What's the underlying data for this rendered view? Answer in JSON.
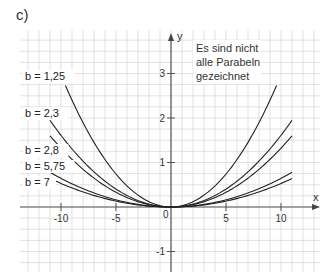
{
  "part_label": "c)",
  "chart_data": {
    "type": "line",
    "title": "",
    "xlabel": "x",
    "ylabel": "y",
    "xlim": [
      -14,
      13.5
    ],
    "ylim": [
      -1.45,
      3.9
    ],
    "grid": true,
    "grid_step_x": 1,
    "grid_step_y": 0.25,
    "x_ticks": [
      -10,
      -5,
      5,
      10
    ],
    "x_tick_labels": [
      "-10",
      "-5",
      "5",
      "10"
    ],
    "y_ticks": [
      3,
      2,
      1,
      -1
    ],
    "y_tick_labels": [
      "3",
      "2",
      "1",
      "-1"
    ],
    "origin_label": "0",
    "function": "y = x^2 / (27 * b)",
    "series": [
      {
        "name": "b = 1,25",
        "b": 1.25,
        "x_range": [
          -9.6,
          9.6
        ]
      },
      {
        "name": "b = 2,3",
        "b": 2.3,
        "x_range": [
          -11,
          11
        ]
      },
      {
        "name": "b = 2,8",
        "b": 2.8,
        "x_range": [
          -11,
          11
        ]
      },
      {
        "name": "b = 5,75",
        "b": 5.75,
        "x_range": [
          -11,
          11
        ]
      },
      {
        "name": "b = 7",
        "b": 7,
        "x_range": [
          -11,
          11
        ]
      }
    ],
    "sample_points": [
      {
        "b": 1.25,
        "x": [
          -9.6,
          0,
          9.6
        ],
        "y": [
          2.73,
          0,
          2.73
        ]
      },
      {
        "b": 2.3,
        "x": [
          -11,
          0,
          11
        ],
        "y": [
          1.95,
          0,
          1.95
        ]
      },
      {
        "b": 2.8,
        "x": [
          -11,
          0,
          11
        ],
        "y": [
          1.6,
          0,
          1.6
        ]
      },
      {
        "b": 5.75,
        "x": [
          -11,
          0,
          11
        ],
        "y": [
          0.78,
          0,
          0.78
        ]
      },
      {
        "b": 7,
        "x": [
          -11,
          0,
          11
        ],
        "y": [
          0.64,
          0,
          0.64
        ]
      }
    ],
    "annotation": [
      "Es sind nicht",
      "alle Parabeln",
      "gezeichnet"
    ]
  }
}
